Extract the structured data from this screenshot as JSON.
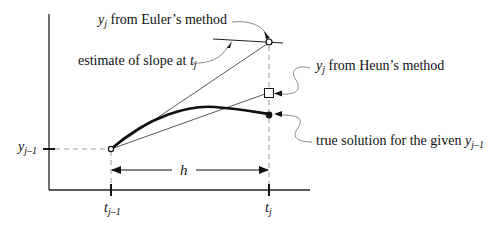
{
  "diagram": {
    "type": "numerical-ode-step-comparison",
    "labels": {
      "euler": {
        "var": "y",
        "sub": "j",
        "text": " from Euler’s method"
      },
      "slope": {
        "text": "estimate of slope at ",
        "var": "t",
        "sub": "j"
      },
      "heun": {
        "var": "y",
        "sub": "j",
        "text": " from Heun’s method"
      },
      "true_solution": {
        "text": "true solution for the given ",
        "var": "y",
        "sub": "j–1"
      },
      "y_axis_tick": {
        "var": "y",
        "sub": "j–1"
      },
      "x_tick_left": {
        "var": "t",
        "sub": "j–1"
      },
      "x_tick_right": {
        "var": "t",
        "sub": "j"
      },
      "step": "h"
    },
    "points": {
      "start": {
        "name": "(t_{j-1}, y_{j-1})",
        "marker": "open-circle"
      },
      "euler": {
        "name": "y_j Euler",
        "marker": "open-circle"
      },
      "heun": {
        "name": "y_j Heun",
        "marker": "open-square"
      },
      "true": {
        "name": "true solution",
        "marker": "filled-circle"
      }
    },
    "colors": {
      "ink": "#111111",
      "leader": "#8a8a8a",
      "guide": "#9a9a9a"
    }
  }
}
